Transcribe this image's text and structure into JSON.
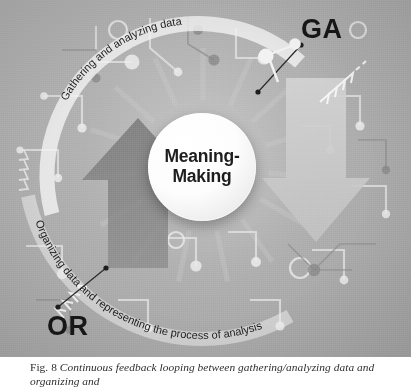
{
  "figure": {
    "center": {
      "line1": "Meaning-",
      "line2": "Making"
    },
    "labels": {
      "ga": "GA",
      "or": "OR"
    },
    "arc_texts": {
      "top": "Gathering and analyzing data",
      "bottom": "Organizing data and representing the process of analysis"
    },
    "arrows": [
      {
        "name": "up-arrow-left",
        "direction": "up",
        "color": "#7d7d7d"
      },
      {
        "name": "down-arrow-right",
        "direction": "down",
        "color": "#c9c9c9"
      }
    ],
    "colors": {
      "background": "#adadad",
      "disc": "#ffffff",
      "text_dark": "#171717",
      "arrow_dark": "#7d7d7d",
      "arrow_light": "#c9c9c9",
      "band": "#f2f2f2"
    }
  },
  "caption": {
    "figure_number": "Fig. 8",
    "text": "Continuous feedback looping between gathering/analyzing data and organizing and"
  }
}
